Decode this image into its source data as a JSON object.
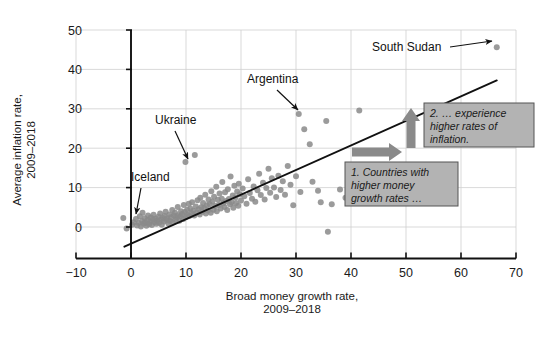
{
  "chart_data": {
    "type": "scatter",
    "title": "",
    "xlabel": "Broad money growth rate, 2009–2018",
    "xlabel_line1": "Broad money growth rate,",
    "xlabel_line2": "2009–2018",
    "ylabel": "Average inflation rate, 2009–2018",
    "ylabel_line1": "Average inflation rate,",
    "ylabel_line2": "2009–2018",
    "xlim": [
      -10,
      70
    ],
    "ylim": [
      -8,
      50
    ],
    "xticks": [
      -10,
      0,
      10,
      20,
      30,
      40,
      50,
      60,
      70
    ],
    "xtick_labels": [
      "−10",
      "0",
      "10",
      "20",
      "30",
      "40",
      "50",
      "60",
      "70"
    ],
    "yticks": [
      0,
      10,
      20,
      30,
      40,
      50
    ],
    "ytick_labels": [
      "0",
      "10",
      "20",
      "30",
      "40",
      "50"
    ],
    "grid": true,
    "grid_color": "#cfcfcf",
    "point_color": "#8a8a8a",
    "point_radius": 3.0,
    "legend": "none",
    "trendline": {
      "type": "linear",
      "color": "#111111",
      "x_start": -1.2,
      "y_start": -5.0,
      "x_end": 66.5,
      "y_end": 37.2
    },
    "points": [
      [
        -1.4,
        2.3
      ],
      [
        -0.8,
        -0.4
      ],
      [
        0.2,
        0.6
      ],
      [
        0.5,
        1.2
      ],
      [
        0.9,
        2.0
      ],
      [
        1.1,
        0.4
      ],
      [
        1.4,
        1.0
      ],
      [
        1.6,
        2.7
      ],
      [
        1.8,
        0.1
      ],
      [
        2.0,
        1.5
      ],
      [
        2.1,
        3.6
      ],
      [
        2.3,
        0.9
      ],
      [
        2.5,
        2.2
      ],
      [
        2.6,
        1.1
      ],
      [
        2.8,
        0.3
      ],
      [
        3.0,
        1.8
      ],
      [
        3.1,
        2.9
      ],
      [
        3.3,
        0.7
      ],
      [
        3.5,
        1.4
      ],
      [
        3.6,
        2.4
      ],
      [
        3.8,
        0.5
      ],
      [
        4.0,
        1.9
      ],
      [
        4.1,
        3.1
      ],
      [
        4.3,
        1.2
      ],
      [
        4.5,
        2.1
      ],
      [
        4.6,
        0.8
      ],
      [
        4.8,
        1.6
      ],
      [
        5.0,
        2.6
      ],
      [
        5.1,
        1.1
      ],
      [
        5.3,
        3.4
      ],
      [
        5.5,
        1.9
      ],
      [
        5.6,
        0.6
      ],
      [
        5.8,
        2.3
      ],
      [
        6.0,
        1.4
      ],
      [
        6.1,
        2.8
      ],
      [
        6.3,
        3.9
      ],
      [
        6.5,
        1.7
      ],
      [
        6.6,
        2.2
      ],
      [
        6.8,
        0.9
      ],
      [
        7.0,
        3.2
      ],
      [
        7.1,
        1.5
      ],
      [
        7.3,
        2.5
      ],
      [
        7.5,
        4.3
      ],
      [
        7.6,
        1.2
      ],
      [
        7.8,
        2.9
      ],
      [
        8.0,
        3.6
      ],
      [
        8.1,
        1.8
      ],
      [
        8.3,
        2.4
      ],
      [
        8.5,
        5.1
      ],
      [
        8.6,
        3.0
      ],
      [
        8.8,
        1.6
      ],
      [
        9.0,
        2.7
      ],
      [
        9.1,
        4.0
      ],
      [
        9.3,
        3.3
      ],
      [
        9.5,
        2.0
      ],
      [
        9.6,
        5.6
      ],
      [
        9.8,
        3.8
      ],
      [
        9.9,
        16.5
      ],
      [
        10.0,
        2.5
      ],
      [
        10.2,
        4.4
      ],
      [
        10.3,
        3.1
      ],
      [
        10.5,
        5.9
      ],
      [
        10.6,
        2.8
      ],
      [
        10.8,
        4.7
      ],
      [
        11.0,
        3.5
      ],
      [
        11.1,
        6.3
      ],
      [
        11.3,
        4.1
      ],
      [
        11.5,
        2.9
      ],
      [
        11.6,
        18.3
      ],
      [
        11.8,
        5.2
      ],
      [
        12.0,
        3.7
      ],
      [
        12.1,
        6.8
      ],
      [
        12.3,
        4.5
      ],
      [
        12.5,
        3.2
      ],
      [
        12.6,
        7.4
      ],
      [
        12.8,
        5.0
      ],
      [
        13.0,
        3.9
      ],
      [
        13.1,
        6.1
      ],
      [
        13.3,
        4.8
      ],
      [
        13.5,
        8.2
      ],
      [
        13.6,
        3.4
      ],
      [
        13.8,
        5.5
      ],
      [
        14.0,
        4.2
      ],
      [
        14.1,
        7.0
      ],
      [
        14.3,
        5.8
      ],
      [
        14.5,
        3.6
      ],
      [
        14.6,
        9.1
      ],
      [
        14.8,
        6.5
      ],
      [
        15.0,
        4.4
      ],
      [
        15.1,
        7.7
      ],
      [
        15.3,
        5.3
      ],
      [
        15.5,
        10.2
      ],
      [
        15.6,
        4.0
      ],
      [
        15.8,
        6.9
      ],
      [
        16.0,
        5.6
      ],
      [
        16.1,
        8.5
      ],
      [
        16.3,
        4.7
      ],
      [
        16.5,
        7.2
      ],
      [
        16.6,
        11.4
      ],
      [
        16.8,
        6.0
      ],
      [
        17.0,
        5.1
      ],
      [
        17.1,
        8.8
      ],
      [
        17.3,
        6.6
      ],
      [
        17.5,
        4.3
      ],
      [
        17.6,
        9.6
      ],
      [
        17.8,
        7.1
      ],
      [
        18.0,
        5.8
      ],
      [
        18.1,
        12.8
      ],
      [
        18.3,
        6.3
      ],
      [
        18.5,
        8.0
      ],
      [
        18.6,
        4.9
      ],
      [
        18.8,
        10.5
      ],
      [
        19.0,
        7.5
      ],
      [
        19.1,
        6.1
      ],
      [
        19.3,
        9.0
      ],
      [
        19.5,
        5.4
      ],
      [
        19.6,
        11.0
      ],
      [
        19.8,
        8.3
      ],
      [
        20.0,
        6.7
      ],
      [
        20.3,
        9.8
      ],
      [
        20.6,
        7.8
      ],
      [
        21.0,
        5.9
      ],
      [
        21.3,
        12.1
      ],
      [
        21.6,
        8.6
      ],
      [
        22.0,
        7.2
      ],
      [
        22.3,
        10.3
      ],
      [
        22.6,
        6.4
      ],
      [
        23.0,
        9.3
      ],
      [
        23.3,
        13.5
      ],
      [
        23.6,
        8.1
      ],
      [
        24.0,
        11.2
      ],
      [
        24.3,
        7.0
      ],
      [
        24.6,
        9.9
      ],
      [
        25.0,
        14.8
      ],
      [
        25.3,
        8.7
      ],
      [
        25.6,
        12.4
      ],
      [
        26.0,
        10.0
      ],
      [
        26.4,
        7.6
      ],
      [
        26.8,
        13.0
      ],
      [
        27.2,
        9.4
      ],
      [
        27.6,
        11.6
      ],
      [
        28.0,
        8.2
      ],
      [
        28.5,
        15.5
      ],
      [
        29.0,
        10.7
      ],
      [
        29.5,
        5.5
      ],
      [
        30.0,
        12.9
      ],
      [
        30.5,
        28.7
      ],
      [
        30.8,
        8.9
      ],
      [
        31.5,
        24.8
      ],
      [
        32.5,
        21.0
      ],
      [
        33.0,
        11.5
      ],
      [
        34.0,
        9.2
      ],
      [
        34.5,
        6.3
      ],
      [
        35.5,
        26.9
      ],
      [
        35.8,
        -1.2
      ],
      [
        36.5,
        5.8
      ],
      [
        38.0,
        9.5
      ],
      [
        39.0,
        7.4
      ],
      [
        41.5,
        29.6
      ],
      [
        42.0,
        10.4
      ],
      [
        66.5,
        45.6
      ]
    ],
    "point_annotations": [
      {
        "label": "Iceland",
        "label_x": 131,
        "label_y": 181,
        "arrow_from_x": 141,
        "arrow_from_y": 188,
        "arrow_to_x": 136,
        "arrow_to_y": 214,
        "data_x": 2.0,
        "data_y": 3.6
      },
      {
        "label": "Ukraine",
        "label_x": 155,
        "label_y": 124,
        "arrow_from_x": 175,
        "arrow_from_y": 131,
        "arrow_to_x": 188,
        "arrow_to_y": 159,
        "data_x": 9.9,
        "data_y": 16.5
      },
      {
        "label": "Argentina",
        "label_x": 247,
        "label_y": 83,
        "arrow_from_x": 277,
        "arrow_from_y": 90,
        "arrow_to_x": 298,
        "arrow_to_y": 110,
        "data_x": 30.5,
        "data_y": 28.7
      },
      {
        "label": "South Sudan",
        "label_x": 372,
        "label_y": 51,
        "arrow_from_x": 450,
        "arrow_from_y": 47,
        "arrow_to_x": 492,
        "arrow_to_y": 41,
        "data_x": 66.5,
        "data_y": 45.6
      }
    ],
    "callouts": [
      {
        "id": "callout-inflation",
        "lines": [
          "2. … experience",
          "higher rates of",
          "inflation."
        ],
        "box_x": 424,
        "box_y": 103,
        "box_w": 110,
        "box_h": 44,
        "fill": "#b3b3b3",
        "border": "#555555",
        "arrow_direction": "up"
      },
      {
        "id": "callout-money-growth",
        "lines": [
          "1. Countries with",
          "higher money",
          "growth rates …"
        ],
        "box_x": 345,
        "box_y": 162,
        "box_w": 113,
        "box_h": 44,
        "fill": "#b3b3b3",
        "border": "#555555",
        "arrow_direction": "right"
      }
    ],
    "callout_arrows": [
      {
        "id": "up-arrow",
        "direction": "up",
        "x": 411,
        "y_top": 108,
        "y_bottom": 148,
        "color": "#8a8a8a"
      },
      {
        "id": "right-arrow",
        "direction": "right",
        "y": 152,
        "x_left": 352,
        "x_right": 402,
        "color": "#8a8a8a"
      }
    ]
  },
  "colors": {
    "point": "#8a8a8a",
    "grid": "#cfcfcf",
    "axis": "#111111",
    "callout_fill": "#b3b3b3",
    "callout_border": "#555555",
    "arrow": "#8a8a8a",
    "background": "#ffffff"
  }
}
